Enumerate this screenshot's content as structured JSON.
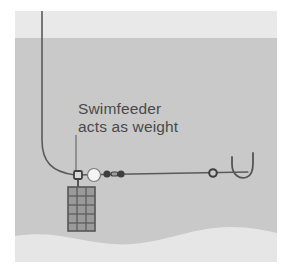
{
  "diagram": {
    "title_visible": false,
    "annotation": {
      "line1": "Swimfeeder",
      "line2": "acts as weight",
      "color": "#4a4a4a",
      "x": 78,
      "y": 100
    },
    "colors": {
      "frame": "#ffffff",
      "sky_band": "#e8e8e8",
      "water": "#c9c9c9",
      "riverbed": "#e6e6e6",
      "line": "#5a5a5a",
      "tackle_dark": "#4d4d4d",
      "bead_light": "#f2f2f2",
      "feeder_mesh": "#666666",
      "feeder_fill": "#9a9a9a"
    },
    "scene": {
      "frame_inset": {
        "left": 15,
        "top": 11,
        "right": 277,
        "bottom": 262
      },
      "waterline_y": 38,
      "riverbed_label": "wavy sediment bed"
    },
    "components": [
      {
        "name": "main-line",
        "label": "Main line",
        "type": "curve"
      },
      {
        "name": "swimfeeder-cage",
        "label": "Swimfeeder",
        "type": "mesh-cage",
        "columns": 3,
        "rows": 5
      },
      {
        "name": "leader-drop-line",
        "label": "Annotation leader",
        "type": "line"
      },
      {
        "name": "feeder-swivel",
        "label": "Feeder swivel",
        "type": "ring"
      },
      {
        "name": "stop-bead",
        "label": "Stop bead",
        "type": "bead"
      },
      {
        "name": "barrel-swivel",
        "label": "Barrel swivel",
        "type": "swivel"
      },
      {
        "name": "hook-link-bead",
        "label": "Hook link bead",
        "type": "bead"
      },
      {
        "name": "fishing-hook",
        "label": "Hook",
        "type": "hook"
      }
    ]
  }
}
